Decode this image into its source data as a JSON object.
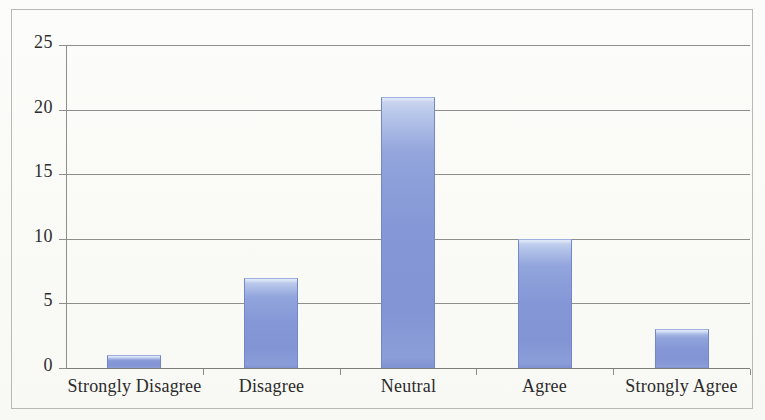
{
  "chart_data": {
    "type": "bar",
    "title": "",
    "subtitle": "",
    "xlabel": "",
    "ylabel": "",
    "categories": [
      "Strongly Disagree",
      "Disagree",
      "Neutral",
      "Agree",
      "Strongly Agree"
    ],
    "values": [
      1,
      7,
      21,
      10,
      3
    ],
    "ylim": [
      0,
      25
    ],
    "ytick_labels": [
      "0",
      "5",
      "10",
      "15",
      "20",
      "25"
    ],
    "ytick_values": [
      0,
      5,
      10,
      15,
      20,
      25
    ],
    "grid": true,
    "legend": false,
    "legend_position": "none",
    "series": [
      {
        "name": "Responses",
        "values": [
          1,
          7,
          21,
          10,
          3
        ]
      }
    ],
    "colors": {
      "bar_fill": "#8597d6",
      "bar_highlight": "#ced9f0",
      "bar_edge": "#7486c6",
      "gridline": "#8e8e8c",
      "axis": "#8e8e8c",
      "text": "#2b2b2b",
      "background": "#fdfdfb",
      "frame_border": "#b9b9b6"
    }
  }
}
